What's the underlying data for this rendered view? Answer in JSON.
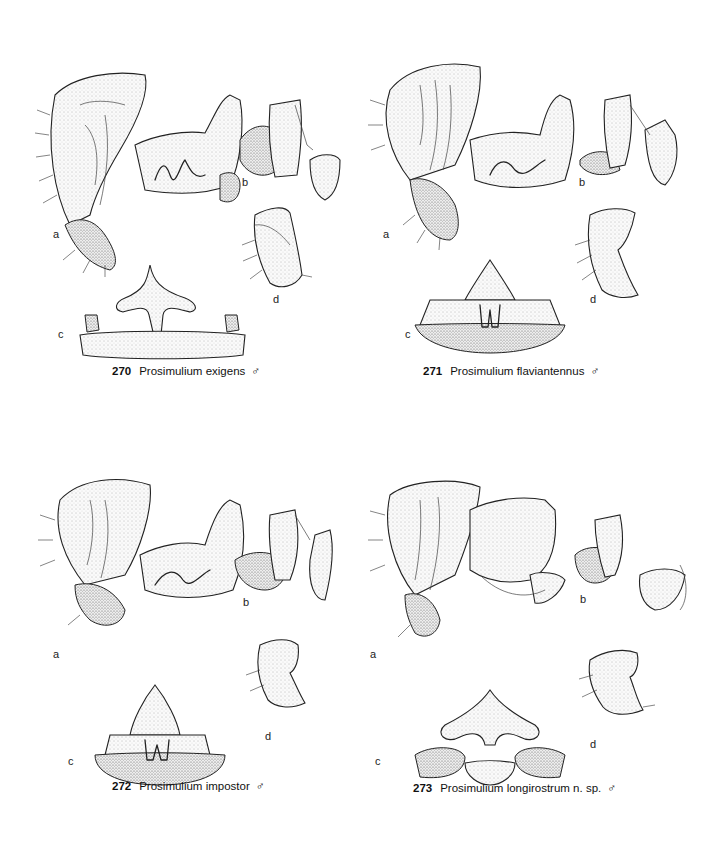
{
  "plate": {
    "figures": [
      {
        "number": "270",
        "species": "Prosimulium exigens",
        "sex_symbol": "♂",
        "panels": [
          "a",
          "b",
          "c",
          "d"
        ]
      },
      {
        "number": "271",
        "species": "Prosimulium flaviantennus",
        "sex_symbol": "♂",
        "panels": [
          "a",
          "b",
          "c",
          "d"
        ]
      },
      {
        "number": "272",
        "species": "Prosimulium impostor",
        "sex_symbol": "♂",
        "panels": [
          "a",
          "b",
          "c",
          "d"
        ]
      },
      {
        "number": "273",
        "species": "Prosimulium longirostrum n. sp.",
        "sex_symbol": "♂",
        "panels": [
          "a",
          "b",
          "c",
          "d"
        ]
      }
    ],
    "ink_color": "#222222",
    "background": "#ffffff"
  }
}
